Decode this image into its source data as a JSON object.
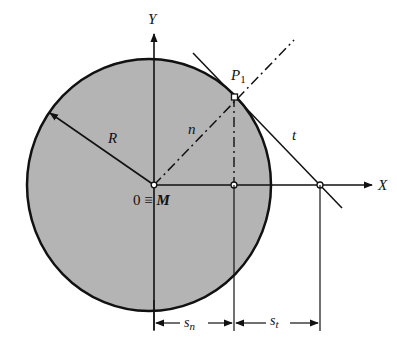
{
  "diagram": {
    "title": "",
    "labels": {
      "y_axis": "Y",
      "x_axis": "X",
      "radius": "R",
      "point": "P",
      "point_sub": "1",
      "normal": "n",
      "tangent": "t",
      "origin": "0 ≡ ",
      "origin_m": "M",
      "sn_base": "s",
      "sn_sub": "n",
      "st_base": "s",
      "st_sub": "t"
    },
    "colors": {
      "circle_fill": "#b4b4b4",
      "stroke": "#111111",
      "background": "#ffffff"
    },
    "geometry": {
      "circle_center": [
        149,
        185
      ],
      "circle_radius": 124,
      "origin_M": [
        154,
        185
      ],
      "P1": [
        235,
        97
      ],
      "normal_foot": [
        234,
        185
      ],
      "tangent_x_intercept": [
        320,
        185
      ]
    }
  }
}
